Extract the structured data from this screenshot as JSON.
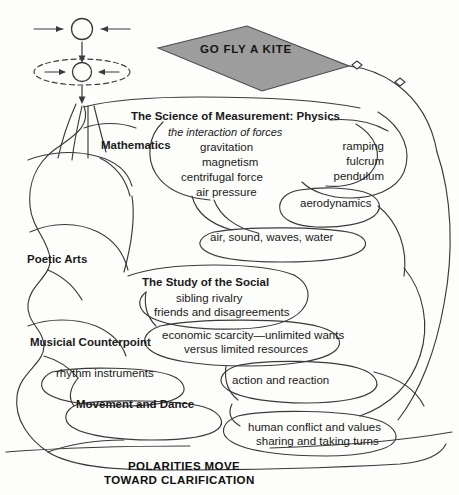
{
  "figure": {
    "kite": {
      "label": "GO FLY A KITE",
      "fill_color": "#9d9d9d",
      "stroke_color": "#4a4a4a"
    },
    "symbols": {
      "top_circle_name": "circle-with-opposing-arrows",
      "bottom_circle_name": "circle-with-opposing-arrows-in-dashed-ellipse"
    },
    "branches": [
      {
        "id": "physics",
        "heading": "The Science of Measurement: Physics",
        "subheading": "the interaction of forces",
        "items": [
          "gravitation",
          "magnetism",
          "centrifugal force",
          "air pressure"
        ]
      },
      {
        "id": "mathematics",
        "heading": "Mathematics",
        "items": []
      },
      {
        "id": "machines",
        "heading": "",
        "items": [
          "ramping",
          "fulcrum",
          "pendulum"
        ]
      },
      {
        "id": "aerodynamics",
        "heading": "aerodynamics",
        "items": []
      },
      {
        "id": "media",
        "heading": "air, sound, waves, water",
        "items": []
      },
      {
        "id": "poetic-arts",
        "heading": "Poetic Arts",
        "items": []
      },
      {
        "id": "social",
        "heading": "The Study of the Social",
        "items": [
          "sibling rivalry",
          "friends and disagreements"
        ]
      },
      {
        "id": "economics",
        "heading": "",
        "items": [
          "economic scarcity—unlimited wants",
          "versus limited resources"
        ]
      },
      {
        "id": "music",
        "heading": "Musicial Counterpoint",
        "items": []
      },
      {
        "id": "rhythm",
        "heading": "rhythm instruments",
        "items": []
      },
      {
        "id": "movement",
        "heading": "Movement and Dance",
        "items": []
      },
      {
        "id": "action",
        "heading": "action and reaction",
        "items": []
      },
      {
        "id": "conflict",
        "heading": "",
        "items": [
          "human conflict and values",
          "sharing and taking turns"
        ]
      }
    ],
    "labels": {
      "physics_heading": "The Science of Measurement: Physics",
      "physics_sub": "the interaction of forces",
      "physics_1": "gravitation",
      "physics_2": "magnetism",
      "physics_3": "centrifugal force",
      "physics_4": "air pressure",
      "mathematics": "Mathematics",
      "ramping": "ramping",
      "fulcrum": "fulcrum",
      "pendulum": "pendulum",
      "aerodynamics": "aerodynamics",
      "media": "air, sound, waves, water",
      "poetic_arts": "Poetic Arts",
      "social_heading": "The Study of the Social",
      "social_1": "sibling rivalry",
      "social_2": "friends and disagreements",
      "econ_1": "economic scarcity—unlimited wants",
      "econ_2": "versus limited resources",
      "music": "Musicial Counterpoint",
      "rhythm": "rhythm instruments",
      "movement": "Movement and Dance",
      "action": "action and reaction",
      "conflict_1": "human conflict and values",
      "conflict_2": "sharing and taking turns",
      "bottom_1": "POLARITIES MOVE",
      "bottom_2": "TOWARD CLARIFICATION"
    },
    "style": {
      "line_color": "#3a3a3a",
      "text_color": "#1a1a1a",
      "background": "#fdfdfc"
    }
  }
}
